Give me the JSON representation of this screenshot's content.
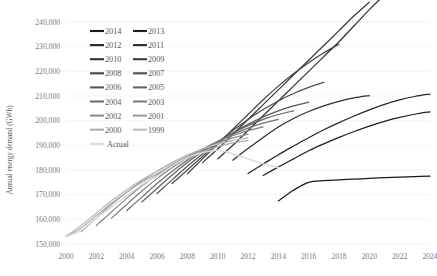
{
  "chart_data": {
    "type": "line",
    "title": "",
    "xlabel": "",
    "ylabel": "Annual energy demand (GWh)",
    "xlim": [
      2000,
      2024
    ],
    "ylim": [
      150000,
      240000
    ],
    "grid": true,
    "legend_position": "top-left-inside",
    "x_ticks": [
      "2000",
      "2002",
      "2004",
      "2006",
      "2008",
      "2010",
      "2012",
      "2014",
      "2016",
      "2018",
      "2020",
      "2022",
      "2024"
    ],
    "y_ticks": [
      "150,000",
      "160,000",
      "170,000",
      "180,000",
      "190,000",
      "200,000",
      "210,000",
      "220,000",
      "230,000",
      "240,000"
    ],
    "series": [
      {
        "name": "2014",
        "color": "#1a1a1a",
        "x": [
          2014,
          2015,
          2016,
          2017,
          2018,
          2019,
          2020,
          2021,
          2022,
          2023,
          2024
        ],
        "values": [
          167500,
          171800,
          175000,
          175700,
          176000,
          176300,
          176600,
          176900,
          177100,
          177300,
          177500
        ]
      },
      {
        "name": "2013",
        "color": "#1f1f1f",
        "x": [
          2013,
          2014,
          2015,
          2016,
          2017,
          2018,
          2019,
          2020,
          2021,
          2022,
          2023,
          2024
        ],
        "values": [
          177800,
          181200,
          184500,
          187800,
          190600,
          193200,
          195600,
          197800,
          199700,
          201300,
          202600,
          203600
        ]
      },
      {
        "name": "2012",
        "color": "#262626",
        "x": [
          2012,
          2013,
          2014,
          2015,
          2016,
          2017,
          2018,
          2019,
          2020,
          2021,
          2022,
          2023,
          2024
        ],
        "values": [
          178600,
          182400,
          186200,
          189700,
          193100,
          196300,
          199200,
          201900,
          204400,
          206600,
          208400,
          209800,
          210800
        ]
      },
      {
        "name": "2011",
        "color": "#2e2e2e",
        "x": [
          2011,
          2012,
          2013,
          2014,
          2015,
          2016,
          2017,
          2018,
          2019,
          2020
        ],
        "values": [
          184000,
          188700,
          193200,
          197400,
          200900,
          203700,
          206000,
          207800,
          209200,
          210200
        ]
      },
      {
        "name": "2010",
        "color": "#333333",
        "x": [
          2010,
          2011,
          2012,
          2013,
          2014,
          2015,
          2016,
          2017,
          2018,
          2019,
          2020,
          2021
        ],
        "values": [
          184500,
          190000,
          196000,
          202000,
          208000,
          214000,
          220000,
          226000,
          232000,
          238500,
          245000,
          251000
        ]
      },
      {
        "name": "2009",
        "color": "#3b3b3b",
        "x": [
          2009,
          2010,
          2011,
          2012,
          2013,
          2014,
          2015,
          2016,
          2017,
          2018,
          2019,
          2020
        ],
        "values": [
          183000,
          188500,
          194500,
          200500,
          206500,
          212500,
          218500,
          224500,
          230500,
          236500,
          242500,
          248000
        ]
      },
      {
        "name": "2008",
        "color": "#434343",
        "x": [
          2008,
          2009,
          2010,
          2011,
          2012,
          2013,
          2014,
          2015,
          2016,
          2017,
          2018
        ],
        "values": [
          178500,
          184500,
          190500,
          196500,
          202500,
          208500,
          214000,
          219000,
          223500,
          227500,
          231000
        ]
      },
      {
        "name": "2007",
        "color": "#4c4c4c",
        "x": [
          2007,
          2008,
          2009,
          2010,
          2011,
          2012,
          2013,
          2014,
          2015,
          2016,
          2017
        ],
        "values": [
          174500,
          180000,
          185500,
          191000,
          196000,
          200500,
          204500,
          208000,
          211000,
          213500,
          215500
        ]
      },
      {
        "name": "2006",
        "color": "#555555",
        "x": [
          2006,
          2007,
          2008,
          2009,
          2010,
          2011,
          2012,
          2013,
          2014,
          2015,
          2016
        ],
        "values": [
          170500,
          176000,
          181500,
          186500,
          191000,
          195000,
          198500,
          201500,
          204000,
          206000,
          207500
        ]
      },
      {
        "name": "2005",
        "color": "#636363",
        "x": [
          2005,
          2006,
          2007,
          2008,
          2009,
          2010,
          2011,
          2012,
          2013,
          2014,
          2015
        ],
        "values": [
          167000,
          172500,
          178000,
          183000,
          187500,
          191500,
          195000,
          198000,
          200500,
          202500,
          204000
        ]
      },
      {
        "name": "2004",
        "color": "#707070",
        "x": [
          2004,
          2005,
          2006,
          2007,
          2008,
          2009,
          2010,
          2011,
          2012,
          2013,
          2014
        ],
        "values": [
          163500,
          169000,
          174500,
          179500,
          184000,
          188000,
          191500,
          194500,
          197000,
          199000,
          200500
        ]
      },
      {
        "name": "2003",
        "color": "#7d7d7d",
        "x": [
          2003,
          2004,
          2005,
          2006,
          2007,
          2008,
          2009,
          2010,
          2011,
          2012,
          2013
        ],
        "values": [
          160500,
          166000,
          171500,
          176500,
          181000,
          185000,
          188500,
          191500,
          194000,
          196000,
          197500
        ]
      },
      {
        "name": "2002",
        "color": "#8d8d8d",
        "x": [
          2002,
          2003,
          2004,
          2005,
          2006,
          2007,
          2008,
          2009,
          2010,
          2011,
          2012
        ],
        "values": [
          157500,
          163000,
          168500,
          173500,
          178000,
          182000,
          185500,
          188500,
          191000,
          193000,
          194500
        ]
      },
      {
        "name": "2001",
        "color": "#9c9c9c",
        "x": [
          2001,
          2002,
          2003,
          2004,
          2005,
          2006,
          2007,
          2008,
          2009,
          2010,
          2011
        ],
        "values": [
          155000,
          160500,
          166000,
          171000,
          175500,
          179500,
          183000,
          186000,
          188500,
          190500,
          192000
        ]
      },
      {
        "name": "2000",
        "color": "#adadad",
        "x": [
          2000,
          2001,
          2002,
          2003,
          2004,
          2005,
          2006,
          2007,
          2008,
          2009,
          2010,
          2011,
          2012
        ],
        "values": [
          153000,
          156500,
          161500,
          166500,
          171000,
          175000,
          178500,
          182000,
          185000,
          187500,
          189500,
          191000,
          192000
        ]
      },
      {
        "name": "1999",
        "color": "#bcbcbc",
        "x": [
          2000,
          2001,
          2002,
          2003,
          2004,
          2005,
          2006,
          2007,
          2008,
          2009,
          2010,
          2011,
          2012
        ],
        "values": [
          153200,
          157500,
          162500,
          167500,
          172000,
          176000,
          179500,
          183000,
          186000,
          188500,
          190500,
          192000,
          193000
        ]
      },
      {
        "name": "Actual",
        "color": "#d9d9d9",
        "x": [
          2000,
          2001,
          2002,
          2003,
          2004,
          2005,
          2006,
          2007,
          2008,
          2009,
          2010,
          2011,
          2012,
          2013,
          2014
        ],
        "values": [
          153000,
          155500,
          160500,
          165000,
          169500,
          174000,
          177500,
          181500,
          185000,
          187000,
          188000,
          186500,
          184500,
          182500,
          181000
        ]
      }
    ],
    "legend": {
      "columns": [
        [
          "2014",
          "2012",
          "2010",
          "2008",
          "2006",
          "2004",
          "2002",
          "2000"
        ],
        [
          "2013",
          "2011",
          "2009",
          "2007",
          "2005",
          "2003",
          "2001",
          "1999"
        ]
      ],
      "extra_row": [
        "Actual"
      ],
      "swatch_colors_left": [
        "#1a1a1a",
        "#262626",
        "#333333",
        "#434343",
        "#555555",
        "#707070",
        "#8d8d8d",
        "#adadad"
      ],
      "swatch_colors_right": [
        "#1f1f1f",
        "#2e2e2e",
        "#3b3b3b",
        "#4c4c4c",
        "#636363",
        "#7d7d7d",
        "#9c9c9c",
        "#bcbcbc"
      ],
      "extra_swatch_color": "#d9d9d9"
    }
  }
}
